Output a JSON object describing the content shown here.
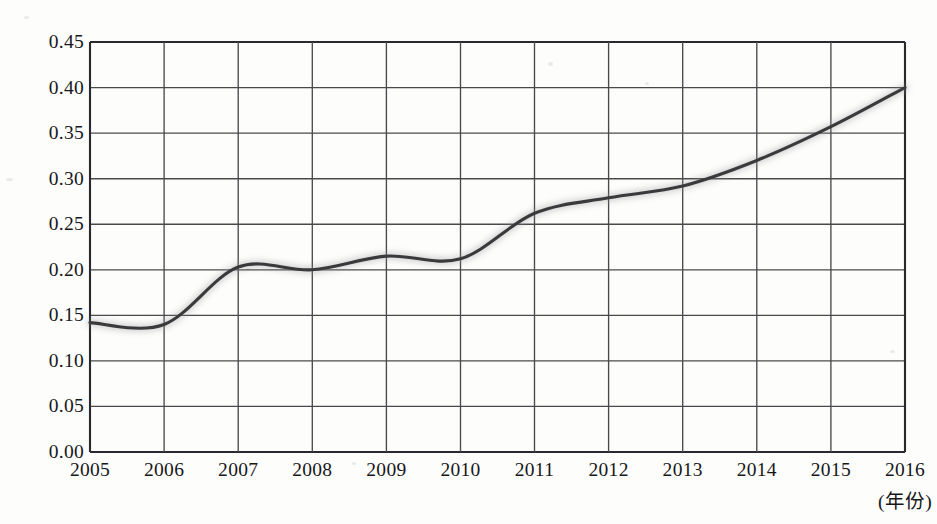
{
  "chart_data": {
    "type": "line",
    "title": "",
    "subtitle": "",
    "xlabel": "(年份)",
    "ylabel": "",
    "x": [
      2005,
      2006,
      2007,
      2008,
      2009,
      2010,
      2011,
      2012,
      2013,
      2014,
      2015,
      2016
    ],
    "categories": [
      "2005",
      "2006",
      "2007",
      "2008",
      "2009",
      "2010",
      "2011",
      "2012",
      "2013",
      "2014",
      "2015",
      "2016"
    ],
    "values": [
      0.142,
      0.14,
      0.203,
      0.2,
      0.215,
      0.212,
      0.262,
      0.279,
      0.292,
      0.32,
      0.357,
      0.4
    ],
    "series": [
      {
        "name": "",
        "values": [
          0.142,
          0.14,
          0.203,
          0.2,
          0.215,
          0.212,
          0.262,
          0.279,
          0.292,
          0.32,
          0.357,
          0.4
        ]
      }
    ],
    "xlim": [
      2005,
      2016
    ],
    "ylim": [
      0.0,
      0.45
    ],
    "ytick_labels": [
      "0.45",
      "0.40",
      "0.35",
      "0.30",
      "0.25",
      "0.20",
      "0.15",
      "0.10",
      "0.05",
      "0.00"
    ],
    "ytick_values": [
      0.45,
      0.4,
      0.35,
      0.3,
      0.25,
      0.2,
      0.15,
      0.1,
      0.05,
      0.0
    ],
    "xtick_labels": [
      "2005",
      "2006",
      "2007",
      "2008",
      "2009",
      "2010",
      "2011",
      "2012",
      "2013",
      "2014",
      "2015",
      "2016"
    ],
    "grid": true,
    "legend": null,
    "legend_position": "none",
    "annotations": [],
    "line_color": "#3a3a3c",
    "grid_color": "#4a4a4c",
    "axis_color": "#2b2b2d",
    "background_color": "#fdfdfc"
  },
  "axis": {
    "y_ticks": [
      {
        "label": "0.45",
        "value": 0.45
      },
      {
        "label": "0.40",
        "value": 0.4
      },
      {
        "label": "0.35",
        "value": 0.35
      },
      {
        "label": "0.30",
        "value": 0.3
      },
      {
        "label": "0.25",
        "value": 0.25
      },
      {
        "label": "0.20",
        "value": 0.2
      },
      {
        "label": "0.15",
        "value": 0.15
      },
      {
        "label": "0.10",
        "value": 0.1
      },
      {
        "label": "0.05",
        "value": 0.05
      },
      {
        "label": "0.00",
        "value": 0.0
      }
    ],
    "x_ticks": [
      {
        "label": "2005",
        "value": 2005
      },
      {
        "label": "2006",
        "value": 2006
      },
      {
        "label": "2007",
        "value": 2007
      },
      {
        "label": "2008",
        "value": 2008
      },
      {
        "label": "2009",
        "value": 2009
      },
      {
        "label": "2010",
        "value": 2010
      },
      {
        "label": "2011",
        "value": 2011
      },
      {
        "label": "2012",
        "value": 2012
      },
      {
        "label": "2013",
        "value": 2013
      },
      {
        "label": "2014",
        "value": 2014
      },
      {
        "label": "2015",
        "value": 2015
      },
      {
        "label": "2016",
        "value": 2016
      }
    ],
    "x_unit_label": "(年份)"
  }
}
